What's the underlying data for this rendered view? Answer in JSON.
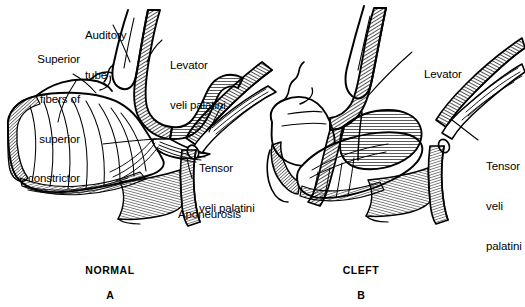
{
  "figure": {
    "background_color": "#ffffff",
    "ink_color": "#000000"
  },
  "panels": [
    {
      "id": "A",
      "name": "NORMAL",
      "letter": "A",
      "labels": [
        {
          "key": "superior_constrictor",
          "text": "Superior\nfibers of\nsuperior\nconstrictor"
        },
        {
          "key": "auditory_tube",
          "text": "Auditory\ntube"
        },
        {
          "key": "levator_veli_palatini",
          "text": "Levator\nveli palatini"
        },
        {
          "key": "tensor_veli_palatini",
          "text": "Tensor\nveli palatini"
        },
        {
          "key": "aponeurosis",
          "text": "Aponeurosis"
        }
      ]
    },
    {
      "id": "B",
      "name": "CLEFT",
      "letter": "B",
      "labels": [
        {
          "key": "levator",
          "text": "Levator"
        },
        {
          "key": "tensor_veli_palatini",
          "text": "Tensor\nveli\npalatini"
        }
      ]
    }
  ],
  "label_text": {
    "superior_fibers_line1": "Superior",
    "superior_fibers_line2": "fibers of",
    "superior_fibers_line3": "superior",
    "superior_fibers_line4": "constrictor",
    "auditory_tube_line1": "Auditory",
    "auditory_tube_line2": "tube",
    "levator_veli_palatini_line1": "Levator",
    "levator_veli_palatini_line2": "veli palatini",
    "tensor_veli_palatini_line1": "Tensor",
    "tensor_veli_palatini_line2": "veli palatini",
    "aponeurosis": "Aponeurosis",
    "levator_right": "Levator",
    "tensor_right_line1": "Tensor",
    "tensor_right_line2": "veli",
    "tensor_right_line3": "palatini",
    "normal_caption": "NORMAL",
    "cleft_caption": "CLEFT",
    "letter_a": "A",
    "letter_b": "B"
  }
}
